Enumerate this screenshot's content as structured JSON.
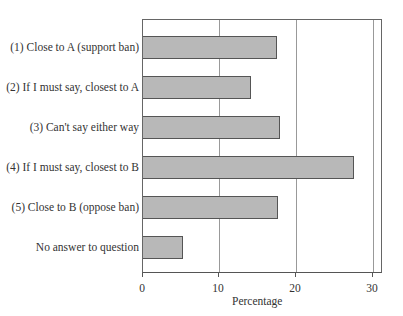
{
  "chart_data": {
    "type": "bar",
    "orientation": "horizontal",
    "title": "",
    "xlabel": "Percentage",
    "ylabel": "",
    "xlim": [
      0,
      31.3
    ],
    "xticks": [
      0,
      10,
      20,
      30
    ],
    "grid": "vertical at 10, 20, 30",
    "categories": [
      "(1) Close to A (support ban)",
      "(2)  If I must say, closest to A",
      "(3) Can't say either way",
      "(4) If I must say, closest to B",
      "(5) Close to B (oppose ban)",
      "No answer to question"
    ],
    "values": [
      17.5,
      14.1,
      17.9,
      27.5,
      17.6,
      5.2
    ],
    "bar_color": "#b8b8b8",
    "edge_color": "#555555"
  },
  "labels": {
    "cat0": "(1) Close to A (support ban)",
    "cat1": "(2)  If I must say, closest to A",
    "cat2": "(3) Can't say either way",
    "cat3": "(4) If I must say, closest to B",
    "cat4": "(5) Close to B (oppose ban)",
    "cat5": "No answer to question",
    "t0": "0",
    "t10": "10",
    "t20": "20",
    "t30": "30",
    "xlabel": "Percentage"
  }
}
